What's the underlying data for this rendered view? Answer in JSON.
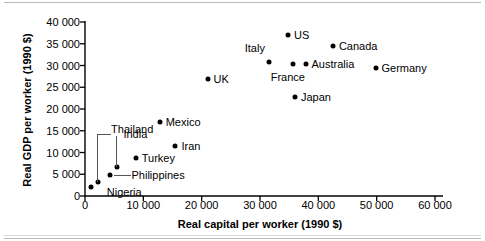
{
  "chart_data": {
    "type": "scatter",
    "title": "",
    "xlabel": "Real capital per worker (1990 $)",
    "ylabel": "Real GDP per worker (1990 $)",
    "xlim": [
      0,
      60000
    ],
    "ylim": [
      0,
      40000
    ],
    "grid": false,
    "legend": "none",
    "xticks": [
      "0",
      "10 000",
      "20 000",
      "30 000",
      "40 000",
      "50 000",
      "60 000"
    ],
    "xtick_values": [
      0,
      10000,
      20000,
      30000,
      40000,
      50000,
      60000
    ],
    "yticks": [
      "0",
      "5 000",
      "10 000",
      "15 000",
      "20 000",
      "25 000",
      "30 000",
      "35 000",
      "40 000"
    ],
    "ytick_values": [
      0,
      5000,
      10000,
      15000,
      20000,
      25000,
      30000,
      35000,
      40000
    ],
    "points": [
      {
        "name": "Nigeria",
        "x": 1000,
        "y": 2000,
        "label_pos": "right-offset",
        "leader": "none"
      },
      {
        "name": "India",
        "x": 2300,
        "y": 3200,
        "label_pos": "elbow-up",
        "leader": "elbow"
      },
      {
        "name": "Philippines",
        "x": 4200,
        "y": 4800,
        "label_pos": "right",
        "leader": "horizontal"
      },
      {
        "name": "Thailand",
        "x": 5500,
        "y": 6700,
        "label_pos": "above",
        "leader": "vertical"
      },
      {
        "name": "Turkey",
        "x": 8700,
        "y": 8700,
        "label_pos": "right",
        "leader": "none"
      },
      {
        "name": "Iran",
        "x": 15500,
        "y": 11500,
        "label_pos": "right",
        "leader": "none"
      },
      {
        "name": "Mexico",
        "x": 12800,
        "y": 17000,
        "label_pos": "right",
        "leader": "none"
      },
      {
        "name": "UK",
        "x": 21000,
        "y": 26900,
        "label_pos": "right",
        "leader": "none"
      },
      {
        "name": "Japan",
        "x": 36000,
        "y": 22700,
        "label_pos": "right",
        "leader": "none"
      },
      {
        "name": "Italy",
        "x": 31500,
        "y": 30800,
        "label_pos": "above-left",
        "leader": "none"
      },
      {
        "name": "France",
        "x": 35600,
        "y": 30400,
        "label_pos": "below",
        "leader": "none"
      },
      {
        "name": "Australia",
        "x": 37800,
        "y": 30300,
        "label_pos": "right",
        "leader": "none"
      },
      {
        "name": "US",
        "x": 34800,
        "y": 37000,
        "label_pos": "right",
        "leader": "none"
      },
      {
        "name": "Canada",
        "x": 42500,
        "y": 34500,
        "label_pos": "right",
        "leader": "none"
      },
      {
        "name": "Germany",
        "x": 49800,
        "y": 29500,
        "label_pos": "right",
        "leader": "none"
      }
    ]
  }
}
